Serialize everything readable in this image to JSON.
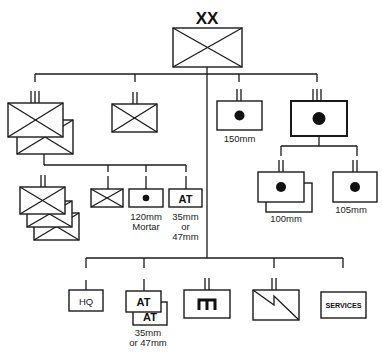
{
  "diagram": {
    "type": "military-order-of-battle",
    "colors": {
      "stroke": "#1a1a1a",
      "fill": "#ffffff",
      "text": "#222222"
    },
    "division": {
      "echelon": "XX",
      "symbol": "infantry"
    },
    "infantry_regiment": {
      "echelon": "III",
      "symbol": "infantry",
      "count": 2
    },
    "independent_battalion": {
      "echelon": "II",
      "symbol": "infantry"
    },
    "regiment_subunits": {
      "battalions": {
        "echelon": "II",
        "symbol": "infantry",
        "count": 3
      },
      "company": {
        "symbol": "infantry"
      },
      "mortar": {
        "symbol": "dot",
        "label_line1": "120mm",
        "label_line2": "Mortar"
      },
      "antitank": {
        "symbol": "AT",
        "label_line1": "35mm",
        "label_line2": "or",
        "label_line3": "47mm"
      }
    },
    "artillery_battalion_150": {
      "echelon": "II",
      "symbol": "dot",
      "label": "150mm"
    },
    "artillery_regiment": {
      "echelon": "III",
      "symbol": "dot"
    },
    "artillery_subunits": [
      {
        "echelon": "II",
        "symbol": "dot",
        "label": "100mm",
        "count": 2
      },
      {
        "echelon": "II",
        "symbol": "dot",
        "label": "105mm",
        "count": 1
      }
    ],
    "divisional_troops": [
      {
        "id": "hq",
        "symbol": "HQ"
      },
      {
        "id": "antitank",
        "symbol": "AT",
        "label_line1": "35mm",
        "label_line2": "or 47mm",
        "count": 2
      },
      {
        "id": "engineer",
        "echelon": "II",
        "symbol": "engineer"
      },
      {
        "id": "signals",
        "echelon": "II",
        "symbol": "signals"
      },
      {
        "id": "services",
        "symbol": "SERVICES"
      }
    ]
  }
}
